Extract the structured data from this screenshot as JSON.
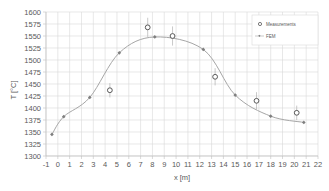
{
  "chart_data": {
    "type": "scatter",
    "title": "",
    "xlabel": "x [m]",
    "ylabel": "T [°C]",
    "xlim": [
      -1,
      22
    ],
    "ylim": [
      1300,
      1600
    ],
    "x_ticks": [
      -1,
      0,
      1,
      2,
      3,
      4,
      5,
      6,
      7,
      8,
      9,
      10,
      11,
      12,
      13,
      14,
      15,
      16,
      17,
      18,
      19,
      20,
      21,
      22
    ],
    "y_ticks": [
      1300,
      1325,
      1350,
      1375,
      1400,
      1425,
      1450,
      1475,
      1500,
      1525,
      1550,
      1575,
      1600
    ],
    "grid": true,
    "legend_position": "upper right",
    "series": [
      {
        "name": "Measurements",
        "style": "open-circle-with-error-bars",
        "color": "#595959",
        "x": [
          4.4,
          7.6,
          9.7,
          13.3,
          16.8,
          20.2
        ],
        "y": [
          1437,
          1568,
          1550,
          1465,
          1415,
          1390
        ],
        "error": [
          15,
          20,
          20,
          18,
          18,
          15
        ]
      },
      {
        "name": "FEM",
        "style": "line-with-diamond-markers",
        "color": "#a6a6a6",
        "marker_color": "#7f7f7f",
        "x": [
          -0.5,
          0.5,
          2.7,
          5.2,
          8.2,
          12.3,
          15.0,
          18.0,
          20.8
        ],
        "y": [
          1345,
          1382,
          1422,
          1515,
          1548,
          1522,
          1427,
          1383,
          1370
        ]
      }
    ]
  },
  "legend": {
    "measurements_label": "Measurements",
    "fem_label": "FEM"
  },
  "axes": {
    "xlabel": "x [m]",
    "ylabel": "T [°C]"
  }
}
